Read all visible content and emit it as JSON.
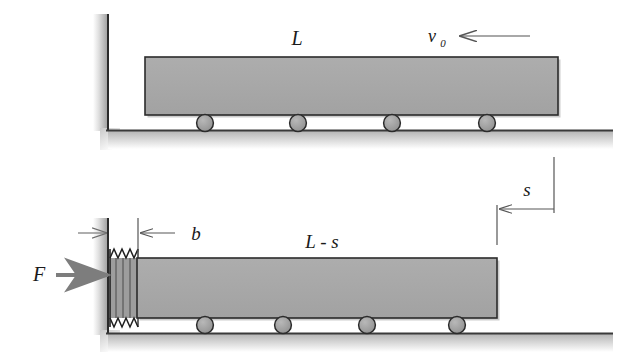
{
  "figure": {
    "kind": "mechanics-diagram",
    "panels": [
      {
        "id": "before-impact",
        "name": "upper-panel",
        "labels": {
          "bar_length": "L",
          "velocity_symbol": "v",
          "velocity_subscript": "0"
        },
        "roller_count": 4,
        "arrows": [
          {
            "name": "velocity-arrow",
            "direction": "left"
          }
        ]
      },
      {
        "id": "during-impact",
        "name": "lower-panel",
        "labels": {
          "bar_length": "L - s",
          "spring_deformation": "b",
          "displacement": "s",
          "force": "F"
        },
        "roller_count": 4,
        "arrows": [
          {
            "name": "force-arrow",
            "direction": "right"
          },
          {
            "name": "spring-compression-arrow",
            "direction": "right"
          },
          {
            "name": "b-dimension-arrow",
            "direction": "left"
          },
          {
            "name": "s-dimension-arrow",
            "direction": "left"
          }
        ]
      }
    ],
    "colors": {
      "bar_fill": "#a8a8a8",
      "bar_stroke": "#2b2b2b",
      "roller_fill": "#9a9a9a",
      "roller_stroke": "#2b2b2b",
      "ground_stroke": "#3a3a3a",
      "wall_stroke": "#2b2b2b",
      "arrow_gray": "#7d7d7d",
      "dimension_line": "#565656",
      "label_text": "#1a1a1a",
      "background": "#ffffff"
    }
  }
}
